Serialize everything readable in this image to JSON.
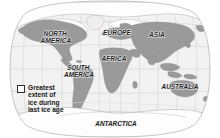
{
  "map": {
    "title": "World map showing greatest extent of ice during last ice age",
    "projection": "robinson",
    "colors": {
      "background": "#ffffff",
      "ocean": "#f2f2f2",
      "land": "#9a9a9a",
      "ice": "#fdfdfd",
      "graticule": "#c9c9c9",
      "coastline": "#8a8a8a",
      "ice_outline": "#9b9b9b",
      "label_text": "#1c1c1c",
      "legend_border": "#2e2e2e"
    },
    "graticule": {
      "visible": true,
      "parallels": [
        -60,
        -30,
        0,
        30,
        60
      ],
      "meridians": [
        -150,
        -120,
        -90,
        -60,
        -30,
        0,
        30,
        60,
        90,
        120,
        150
      ]
    },
    "continent_labels": [
      {
        "name": "north-america",
        "text": "NORTH\nAMERICA",
        "x": 56,
        "y": 36,
        "size": 6.6
      },
      {
        "name": "south-america",
        "text": "SOUTH\nAMERICA",
        "x": 79,
        "y": 70,
        "size": 6.4
      },
      {
        "name": "europe",
        "text": "EUROPE",
        "x": 117,
        "y": 35,
        "size": 6.6
      },
      {
        "name": "africa",
        "text": "AFRICA",
        "x": 114,
        "y": 61,
        "size": 6.6
      },
      {
        "name": "asia",
        "text": "ASIA",
        "x": 157,
        "y": 37,
        "size": 6.6
      },
      {
        "name": "australia",
        "text": "AUSTRALIA",
        "x": 180,
        "y": 89,
        "size": 6.4
      },
      {
        "name": "antarctica",
        "text": "ANTARCTICA",
        "x": 116,
        "y": 126,
        "size": 6.4
      }
    ],
    "legend": {
      "swatch_label": "ice-extent-swatch",
      "text": "Greatest\nextent of\nice during\nlast ice age",
      "lines": [
        "Greatest",
        "extent of",
        "ice during",
        "last ice age"
      ]
    }
  }
}
